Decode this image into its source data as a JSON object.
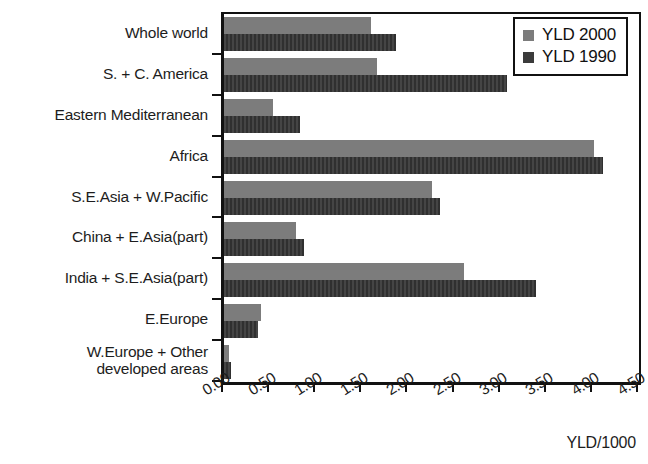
{
  "chart_data": {
    "type": "bar",
    "orientation": "horizontal",
    "title": "",
    "subtitle": "",
    "xlabel": "YLD/1000",
    "ylabel": "",
    "xlim": [
      0,
      4.5
    ],
    "xticks": [
      "0.00",
      "0.50",
      "1.00",
      "1.50",
      "2.00",
      "2.50",
      "3.00",
      "3.50",
      "4.00",
      "4.50"
    ],
    "xtick_values": [
      0,
      0.5,
      1,
      1.5,
      2,
      2.5,
      3,
      3.5,
      4,
      4.5
    ],
    "grid": false,
    "legend_position": "top-right",
    "categories": [
      "Whole world",
      "S. + C. America",
      "Eastern Mediterranean",
      "Africa",
      "S.E.Asia + W.Pacific",
      "China + E.Asia(part)",
      "India + S.E.Asia(part)",
      "E.Europe",
      "W.Europe + Other\ndeveloped areas"
    ],
    "series": [
      {
        "name": "YLD 2000",
        "color": "#7c7c7c",
        "values": [
          1.59,
          1.66,
          0.53,
          4.01,
          2.25,
          0.78,
          2.6,
          0.4,
          0.05
        ]
      },
      {
        "name": "YLD 1990",
        "color": "#3b3b3b",
        "values": [
          1.86,
          3.07,
          0.82,
          4.11,
          2.34,
          0.87,
          3.38,
          0.37,
          0.08
        ]
      }
    ]
  },
  "legend": {
    "entries": [
      {
        "label": "YLD 2000",
        "color": "#7c7c7c"
      },
      {
        "label": "YLD 1990",
        "color": "#3b3b3b"
      }
    ]
  },
  "axis": {
    "x_title": "YLD/1000"
  }
}
